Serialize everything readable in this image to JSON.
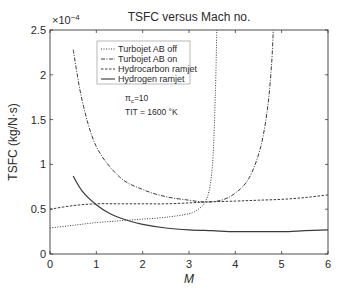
{
  "chart_data": {
    "type": "line",
    "title": "TSFC versus Mach no.",
    "xlabel": "M",
    "ylabel": "TSFC (kg/N·s)",
    "y_multiplier": "×10⁻⁴",
    "xlim": [
      0,
      6
    ],
    "ylim": [
      0,
      2.5
    ],
    "xticks": [
      "0",
      "1",
      "2",
      "3",
      "4",
      "5",
      "6"
    ],
    "yticks": [
      "0",
      "0.5",
      "1",
      "1.5",
      "2",
      "2.5"
    ],
    "grid": false,
    "legend_position": "upper-left",
    "annotations": [
      "πc=10",
      "TIT = 1600 °K"
    ],
    "series": [
      {
        "name": "Turbojet AB off",
        "style": "dotted",
        "x": [
          0,
          0.5,
          1,
          1.5,
          2,
          2.5,
          3,
          3.2,
          3.35,
          3.45,
          3.52,
          3.57,
          3.6
        ],
        "y": [
          0.29,
          0.32,
          0.35,
          0.37,
          0.39,
          0.41,
          0.45,
          0.5,
          0.58,
          0.75,
          1.1,
          1.8,
          2.5
        ]
      },
      {
        "name": "Turbojet AB on",
        "style": "dash-dot",
        "x": [
          0.5,
          0.7,
          1,
          1.5,
          2,
          2.5,
          3,
          3.35,
          3.7,
          4,
          4.3,
          4.55,
          4.7,
          4.78,
          4.82
        ],
        "y": [
          2.28,
          1.7,
          1.2,
          0.86,
          0.72,
          0.64,
          0.6,
          0.58,
          0.6,
          0.68,
          0.85,
          1.2,
          1.65,
          2.1,
          2.5
        ]
      },
      {
        "name": "Hydrocarbon ramjet",
        "style": "dashed",
        "x": [
          0,
          0.5,
          1,
          1.5,
          2,
          2.5,
          3,
          3.35,
          4,
          4.5,
          5,
          5.5,
          6
        ],
        "y": [
          0.5,
          0.54,
          0.56,
          0.56,
          0.56,
          0.56,
          0.57,
          0.58,
          0.59,
          0.6,
          0.61,
          0.63,
          0.66
        ]
      },
      {
        "name": "Hydrogen ramjet",
        "style": "solid",
        "x": [
          0.5,
          0.7,
          1,
          1.3,
          1.7,
          2,
          2.5,
          3,
          3.5,
          4,
          4.5,
          5,
          5.5,
          6
        ],
        "y": [
          0.87,
          0.7,
          0.55,
          0.45,
          0.37,
          0.33,
          0.29,
          0.27,
          0.26,
          0.25,
          0.25,
          0.25,
          0.26,
          0.27
        ]
      }
    ]
  },
  "labels": {
    "title": "TSFC versus Mach no.",
    "multiplier_base": "×10",
    "multiplier_exp": "−4",
    "xlabel": "M",
    "ylabel": "TSFC (kg/N·s)",
    "annot_pi": "π",
    "annot_pi_sub": "c",
    "annot_pi_val": "=10",
    "annot_tit": "TIT = 1600 °K",
    "legend": [
      "Turbojet AB off",
      "Turbojet AB on",
      "Hydrocarbon ramjet",
      "Hydrogen ramjet"
    ],
    "xticks": [
      "0",
      "1",
      "2",
      "3",
      "4",
      "5",
      "6"
    ],
    "yticks": [
      "0",
      "0.5",
      "1",
      "1.5",
      "2",
      "2.5"
    ]
  }
}
